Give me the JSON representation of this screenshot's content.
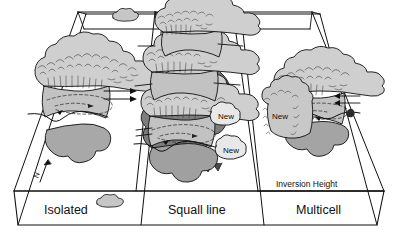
{
  "figure": {
    "type": "convective-storm-types-3d-block-diagram",
    "background_color": "#ffffff",
    "line_color": "#101010"
  },
  "panels": [
    {
      "id": "isolated",
      "label": "Isolated"
    },
    {
      "id": "squall",
      "label": "Squall line"
    },
    {
      "id": "multicell",
      "label": "Multicell"
    }
  ],
  "annotations": {
    "inversion_height": "Inversion Height",
    "north_arrow": "N",
    "new_cell_labels": [
      {
        "id": "new-squall-upper",
        "label": "New"
      },
      {
        "id": "new-squall-lower",
        "label": "New"
      },
      {
        "id": "new-multicell",
        "label": "New"
      }
    ]
  },
  "colors": {
    "anvil_light": "#cfcfcf",
    "cloud_mid": "#c2c2c2",
    "cloud_base": "#a8a8a8",
    "precip_dark": "#8a8a8a",
    "precip_darkest": "#6e6e6e",
    "outline": "#101010",
    "small_cloud": "#c6c6c6"
  }
}
